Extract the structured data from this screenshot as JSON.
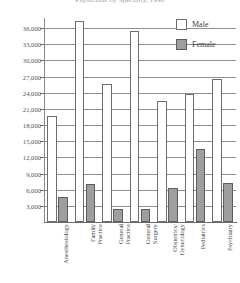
{
  "chart_data": {
    "type": "bar",
    "title": "Physicians by Specialty, 1998",
    "xlabel": "",
    "ylabel": "",
    "ylim": [
      0,
      37500
    ],
    "ytick_step": 3000,
    "yticks": [
      "3,000",
      "6,000",
      "9,000",
      "12,000",
      "15,000",
      "18,000",
      "21,000",
      "24,000",
      "27,000",
      "30,000",
      "33,000",
      "36,000"
    ],
    "grid": true,
    "legend_position": "top-right",
    "categories": [
      "Anesthesiology",
      "Family\nPractice",
      "General\nPractice",
      "General\nSurgery",
      "Obstetrics/\nGynecology",
      "Pediatrics",
      "Psychiatry"
    ],
    "series": [
      {
        "name": "Male",
        "color": "#ffffff",
        "values": [
          19700,
          37400,
          25700,
          35400,
          22500,
          23700,
          26500
        ]
      },
      {
        "name": "Female",
        "color": "#9e9e9e",
        "values": [
          4600,
          7000,
          2400,
          2500,
          6300,
          13500,
          7200
        ]
      }
    ]
  },
  "legend": {
    "items": [
      {
        "label": "Male"
      },
      {
        "label": "Female"
      }
    ]
  }
}
